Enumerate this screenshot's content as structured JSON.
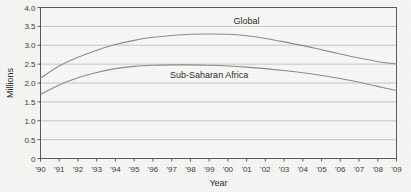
{
  "chart_data": {
    "type": "line",
    "title": "",
    "subtitle": "",
    "xlabel": "Year",
    "ylabel": "Millions",
    "xlim": [
      1990,
      2009
    ],
    "ylim": [
      0,
      4.0
    ],
    "grid": true,
    "grid_axis": "y",
    "legend_position": "inline-annotation",
    "x": [
      1990,
      1991,
      1992,
      1993,
      1994,
      1995,
      1996,
      1997,
      1998,
      1999,
      2000,
      2001,
      2002,
      2003,
      2004,
      2005,
      2006,
      2007,
      2008,
      2009
    ],
    "x_tick_labels": [
      "'90",
      "'91",
      "'92",
      "'93",
      "'94",
      "'95",
      "'96",
      "'97",
      "'98",
      "'99",
      "'00",
      "'01",
      "'02",
      "'03",
      "'04",
      "'05",
      "'06",
      "'07",
      "'08",
      "'09"
    ],
    "y_ticks": [
      0,
      0.5,
      1.0,
      1.5,
      2.0,
      2.5,
      3.0,
      3.5,
      4.0
    ],
    "y_tick_labels": [
      "0",
      "0.5",
      "1.0",
      "1.5",
      "2.0",
      "2.5",
      "3.0",
      "3.5",
      "4.0"
    ],
    "series": [
      {
        "name": "Global",
        "color": "#8c8c8c",
        "label_x": 2001,
        "label_y": 3.55,
        "values": [
          2.13,
          2.45,
          2.68,
          2.87,
          3.02,
          3.13,
          3.21,
          3.26,
          3.29,
          3.3,
          3.29,
          3.25,
          3.18,
          3.09,
          2.99,
          2.88,
          2.77,
          2.66,
          2.57,
          2.5
        ]
      },
      {
        "name": "Sub-Saharan Africa",
        "color": "#8c8c8c",
        "label_x": 1999,
        "label_y": 2.12,
        "values": [
          1.7,
          1.95,
          2.14,
          2.28,
          2.38,
          2.44,
          2.47,
          2.48,
          2.48,
          2.47,
          2.45,
          2.42,
          2.38,
          2.33,
          2.27,
          2.2,
          2.12,
          2.02,
          1.91,
          1.8
        ]
      }
    ]
  },
  "axes": {
    "y_title": "Millions",
    "x_title": "Year"
  }
}
